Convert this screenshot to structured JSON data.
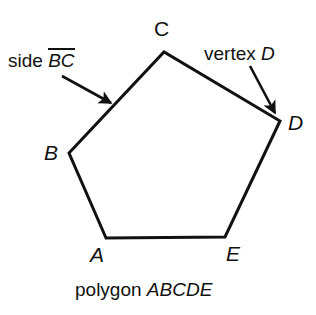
{
  "figure": {
    "background_color": "#ffffff",
    "stroke_color": "#111111",
    "caption": {
      "prefix": "polygon ",
      "name": "ABCDE",
      "full": "polygon ABCDE"
    },
    "annotations": [
      {
        "id": "side-bc",
        "prefix": "side ",
        "segment": "BC",
        "overline": true,
        "full": "side BC",
        "arrow_from": [
          62,
          76
        ],
        "arrow_to": [
          111,
          103
        ]
      },
      {
        "id": "vertex-d",
        "prefix": "vertex ",
        "name": "D",
        "overline": false,
        "full": "vertex D",
        "arrow_from": [
          250,
          66
        ],
        "arrow_to": [
          275,
          113
        ]
      }
    ],
    "polygon": {
      "sides": 5,
      "closed": true,
      "fill": "none",
      "stroke_width": 3,
      "vertices": [
        {
          "label": "A",
          "x": 106,
          "y": 238,
          "label_x": 90,
          "label_y": 244
        },
        {
          "label": "B",
          "x": 69,
          "y": 153,
          "label_x": 44,
          "label_y": 142
        },
        {
          "label": "C",
          "x": 164,
          "y": 52,
          "label_x": 154,
          "label_y": 18
        },
        {
          "label": "D",
          "x": 280,
          "y": 121,
          "label_x": 288,
          "label_y": 112
        },
        {
          "label": "E",
          "x": 225,
          "y": 237,
          "label_x": 226,
          "label_y": 243
        }
      ],
      "edges": [
        "AB",
        "BC",
        "CD",
        "DE",
        "EA"
      ]
    }
  }
}
